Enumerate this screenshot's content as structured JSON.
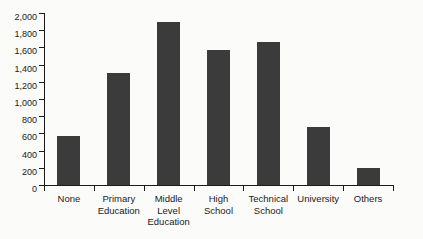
{
  "chart_data": {
    "type": "bar",
    "title": "",
    "subtitle": "",
    "xlabel": "",
    "ylabel": "",
    "ylim": [
      0,
      2000
    ],
    "ytick_step": 200,
    "grid": false,
    "legend": false,
    "bar_color": "#3b3b3b",
    "background_color": "#fbfbfa",
    "axis_color": "#1a1a1a",
    "categories": [
      "None",
      "Primary Education",
      "Middle Level Education",
      "High School",
      "Technical School",
      "University",
      "Others"
    ],
    "category_lines": [
      [
        "None"
      ],
      [
        "Primary",
        "Education"
      ],
      [
        "Middle",
        "Level",
        "Education"
      ],
      [
        "High",
        "School"
      ],
      [
        "Technical",
        "School"
      ],
      [
        "University"
      ],
      [
        "Others"
      ]
    ],
    "values": [
      570,
      1300,
      1900,
      1570,
      1660,
      680,
      200
    ],
    "ytick_labels": [
      "0",
      "200",
      "400",
      "600",
      "800",
      "1,000",
      "1,200",
      "1,400",
      "1,600",
      "1,800",
      "2,000"
    ],
    "ytick_values": [
      0,
      200,
      400,
      600,
      800,
      1000,
      1200,
      1400,
      1600,
      1800,
      2000
    ]
  }
}
